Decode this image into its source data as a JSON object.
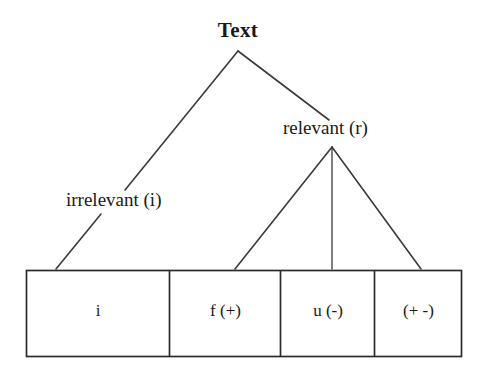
{
  "diagram": {
    "background_color": "#ffffff",
    "stroke_color": "#3a3a3a",
    "text_color": "#1a1a1a",
    "nodes": {
      "root": "Text",
      "left_child": "irrelevant (i)",
      "right_child": "relevant (r)"
    },
    "leaf_boxes": [
      {
        "label": "i"
      },
      {
        "label": "f (+)"
      },
      {
        "label": "u (-)"
      },
      {
        "label": "(+ -)"
      }
    ]
  }
}
